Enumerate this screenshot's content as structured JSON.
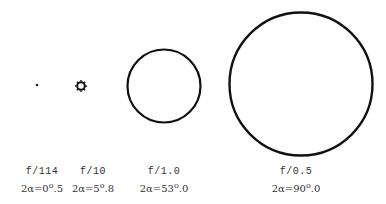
{
  "figure": {
    "items": [
      {
        "f_number": "f/114",
        "angle": "2α=0°5",
        "angle_pre": "2α=0",
        "angle_post": "5",
        "cx": 37,
        "cy": 85,
        "r": 1.2,
        "label_x": 42
      },
      {
        "f_number": "f/10",
        "angle": "2α=5°8",
        "angle_pre": "2α=5",
        "angle_post": "8",
        "cx": 81,
        "cy": 86,
        "r": 4.5,
        "label_x": 90
      },
      {
        "f_number": "f/1.0",
        "angle": "2α=53°0",
        "angle_pre": "2α=53",
        "angle_post": "0",
        "cx": 164,
        "cy": 86,
        "r": 37,
        "label_x": 164
      },
      {
        "f_number": "f/0.5",
        "angle": "2α=90°0",
        "angle_pre": "2α=90",
        "angle_post": "0",
        "cx": 301,
        "cy": 84,
        "r": 72,
        "label_x": 295
      }
    ],
    "degree_symbol": "°"
  }
}
